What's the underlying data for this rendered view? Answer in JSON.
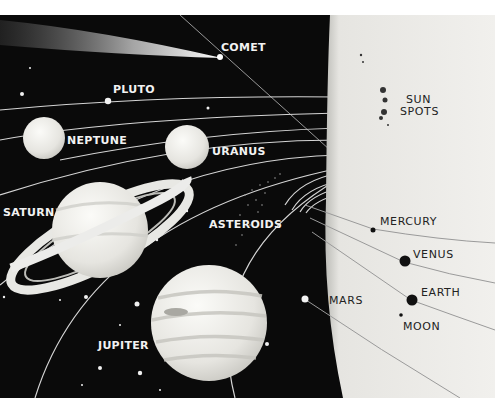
{
  "colors": {
    "space": "#0a0a0a",
    "sun": "#ecebe8",
    "orbit": "#d8d8d8",
    "planet_light": "#eeeeea",
    "dark_planet": "#111111",
    "page": "#ffffff"
  },
  "labels": {
    "comet": "COMET",
    "pluto": "PLUTO",
    "neptune": "NEPTUNE",
    "uranus": "URANUS",
    "saturn": "SATURN",
    "asteroids": "ASTEROIDS",
    "jupiter": "JUPITER",
    "mars": "MARS",
    "mercury": "MERCURY",
    "venus": "VENUS",
    "earth": "EARTH",
    "moon": "MOON",
    "sun_spots_line1": "SUN",
    "sun_spots_line2": "SPOTS"
  }
}
